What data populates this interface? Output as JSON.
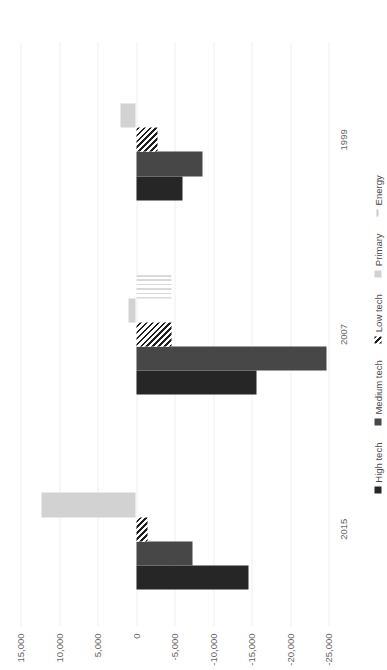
{
  "chart_data": {
    "type": "bar",
    "orientation": "horizontal",
    "title": "",
    "subtitle": "",
    "xlabel": "",
    "ylabel": "",
    "categories": [
      "2015",
      "2007",
      "1999"
    ],
    "category_axis_label": "",
    "value_axis_label": "",
    "ylim": [
      -25000,
      15000
    ],
    "tick_labels": [
      "15,000",
      "10,000",
      "5,000",
      "0",
      "-5,000",
      "-10,000",
      "-15,000",
      "-20,000",
      "-25,000"
    ],
    "tick_values": [
      15000,
      10000,
      5000,
      0,
      -5000,
      -10000,
      -15000,
      -20000,
      -25000
    ],
    "grid": true,
    "legend_position": "bottom",
    "series": [
      {
        "name": "High tech",
        "color": "#262626",
        "pattern": "solid",
        "values": [
          -14600,
          -15600,
          -6100
        ]
      },
      {
        "name": "Medium tech",
        "color": "#474747",
        "pattern": "dotted-fill",
        "values": [
          -7400,
          -24800,
          -8600
        ]
      },
      {
        "name": "Low tech",
        "color": "#1f1f1f",
        "pattern": "diagonal-hatch",
        "values": [
          -1500,
          -4600,
          -2800
        ]
      },
      {
        "name": "Primary",
        "color": "#d2d2d2",
        "pattern": "solid",
        "values": [
          12300,
          1000,
          2000
        ]
      },
      {
        "name": "Energy",
        "color": "#d9d9d9",
        "pattern": "vertical-hatch",
        "values": [
          0,
          -4600,
          0
        ]
      }
    ]
  },
  "legend": {
    "items": [
      {
        "label": "High tech",
        "icon": "legend-swatch-icon"
      },
      {
        "label": "Medium tech",
        "icon": "legend-swatch-icon"
      },
      {
        "label": "Low tech",
        "icon": "legend-swatch-icon"
      },
      {
        "label": "Primary",
        "icon": "legend-swatch-icon"
      },
      {
        "label": "Energy",
        "icon": "legend-line-icon"
      }
    ]
  },
  "colors": {
    "background": "#ffffff",
    "gridline": "#efefef",
    "text": "#666666",
    "high_tech": "#262626",
    "medium_tech": "#474747",
    "low_tech": "#1f1f1f",
    "primary": "#d2d2d2",
    "energy": "#d9d9d9"
  }
}
